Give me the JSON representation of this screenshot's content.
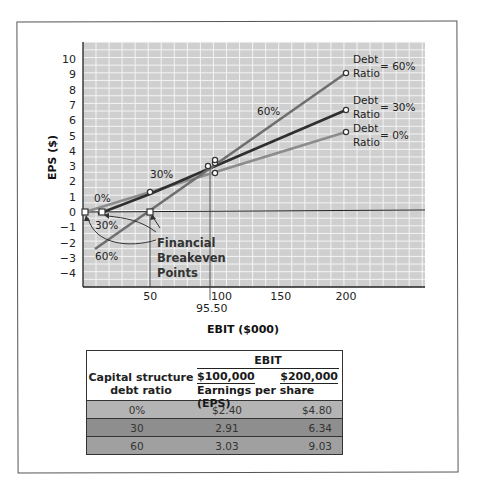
{
  "chart_data": {
    "type": "line",
    "title": "",
    "xlabel": "EBIT ($000)",
    "ylabel": "EPS ($)",
    "xlim": [
      0,
      230
    ],
    "ylim": [
      -4.5,
      10.8
    ],
    "x_ticks": [
      "50",
      "100",
      "150",
      "200"
    ],
    "x_tick_values": [
      50,
      100,
      150,
      200
    ],
    "y_ticks": [
      "10",
      "9",
      "8",
      "7",
      "6",
      "5",
      "4",
      "3",
      "2",
      "1",
      "0",
      "-1",
      "-2",
      "-3",
      "-4"
    ],
    "grid": true,
    "legend_position": "right-annotations",
    "series": [
      {
        "name": "Debt Ratio = 0%",
        "label": "0%",
        "color": "#8c8c8c",
        "points": [
          [
            0,
            0
          ],
          [
            100,
            2.4
          ],
          [
            200,
            4.8
          ]
        ]
      },
      {
        "name": "Debt Ratio = 30%",
        "label": "30%",
        "color": "#2f2f2f",
        "points": [
          [
            12,
            0
          ],
          [
            50,
            1.27
          ],
          [
            100,
            2.91
          ],
          [
            200,
            6.34
          ]
        ]
      },
      {
        "name": "Debt Ratio = 60%",
        "label": "60%",
        "color": "#6f6f6f",
        "points": [
          [
            10,
            -2.5
          ],
          [
            50,
            0
          ],
          [
            100,
            3.03
          ],
          [
            200,
            9.03
          ]
        ]
      }
    ],
    "annotations": [
      {
        "text": "Financial Breakeven Points",
        "points": [
          [
            0,
            0
          ],
          [
            12,
            0
          ],
          [
            50,
            0
          ]
        ]
      },
      {
        "text": "95.50",
        "x": 95.5,
        "note": "indifference point between 30% and 60% lines"
      }
    ]
  },
  "labels": {
    "y_axis": "EPS ($)",
    "x_axis": "EBIT ($000)",
    "x_marker": "95.50",
    "breakeven": [
      "Financial",
      "Breakeven",
      "Points"
    ],
    "line_labels": {
      "l0": "0%",
      "l30": "30%",
      "l60": "60%",
      "l30b": "30%",
      "l60b": "60%"
    },
    "legend": [
      {
        "line1": "Debt",
        "line2": "Ratio",
        "value": "= 60%"
      },
      {
        "line1": "Debt",
        "line2": "Ratio",
        "value": "= 30%"
      },
      {
        "line1": "Debt",
        "line2": "Ratio",
        "value": "= 0%"
      }
    ]
  },
  "table": {
    "col1_header": "Capital structure debt ratio",
    "col1_header_l1": "Capital structure",
    "col1_header_l2": "debt ratio",
    "group_header": "EBIT",
    "ebit_values": [
      "$100,000",
      "$200,000"
    ],
    "sub_header": "Earnings per share (EPS)",
    "rows": [
      {
        "ratio": "0%",
        "eps100": "$2.40",
        "eps200": "$4.80",
        "fill": "#b4b4b4"
      },
      {
        "ratio": "30",
        "eps100": "2.91",
        "eps200": "6.34",
        "fill": "#8e8e8e"
      },
      {
        "ratio": "60",
        "eps100": "3.03",
        "eps200": "9.03",
        "fill": "#a0a0a0"
      }
    ]
  }
}
